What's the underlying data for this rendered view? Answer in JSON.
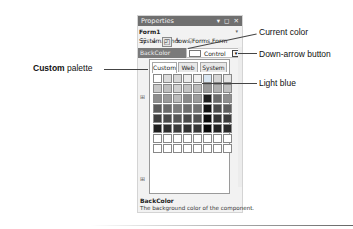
{
  "window": {
    "title": "Properties",
    "controls": "▾ ◻ ✕",
    "object_selector": {
      "name": "Form1",
      "type": "System.Windows.Forms.Form"
    },
    "toolbar": [
      {
        "icon": "categorized-icon",
        "glyph": "☷"
      },
      {
        "icon": "alphabetical-icon",
        "glyph": "↓"
      },
      {
        "icon": "properties-icon",
        "glyph": "◰"
      },
      {
        "icon": "events-icon",
        "glyph": "ϟ"
      },
      {
        "icon": "property-pages-icon",
        "glyph": "⚲"
      }
    ]
  },
  "property": {
    "name": "BackColor",
    "value": "Control",
    "dropdown_glyph": "▾"
  },
  "color_popup": {
    "tabs": [
      {
        "label": "Custom",
        "selected": true
      },
      {
        "label": "Web",
        "selected": false
      },
      {
        "label": "System",
        "selected": false
      }
    ],
    "rows": [
      [
        "#ffffff",
        "#dcdcdc",
        "#d8d8d8",
        "#ececec",
        "#f0f0f0",
        "#d9e6f2",
        "#d6d6d6",
        "#e6e6e6"
      ],
      [
        "#c8c8c8",
        "#bfbfbf",
        "#d0d0d0",
        "#c4c4c4",
        "#bcbcbc",
        "#9a9a9a",
        "#b0b0b0",
        "#c0c0c0"
      ],
      [
        "#8c8c8c",
        "#9a9a9a",
        "#bcbcbc",
        "#8a8a8a",
        "#9c9c9c",
        "#1e1e1e",
        "#6a6a6a",
        "#8e8e8e"
      ],
      [
        "#5a5a5a",
        "#6a6a6a",
        "#7c7c7c",
        "#6e6e6e",
        "#727272",
        "#111111",
        "#4a4a4a",
        "#5e5e5e"
      ],
      [
        "#3e3e3e",
        "#4a4a4a",
        "#565656",
        "#4a4a4a",
        "#525252",
        "#0c0c0c",
        "#333333",
        "#3c3c3c"
      ],
      [
        "#1e1e1e",
        "#2e2e2e",
        "#3a3a3a",
        "#303030",
        "#363636",
        "#080808",
        "#222222",
        "#2a2a2a"
      ],
      [
        "#ffffff",
        "#ffffff",
        "#ffffff",
        "#ffffff",
        "#ffffff",
        "#ffffff",
        "#ffffff",
        "#ffffff"
      ],
      [
        "#ffffff",
        "#ffffff",
        "#ffffff",
        "#ffffff",
        "#ffffff",
        "#ffffff",
        "#ffffff",
        "#ffffff"
      ]
    ]
  },
  "description": {
    "title": "BackColor",
    "text": "The background color of the component."
  },
  "callouts": {
    "custom_bold": "Custom",
    "custom_rest": " palette",
    "current_color": "Current color",
    "down_arrow": "Down-arrow button",
    "light_blue": "Light blue"
  }
}
